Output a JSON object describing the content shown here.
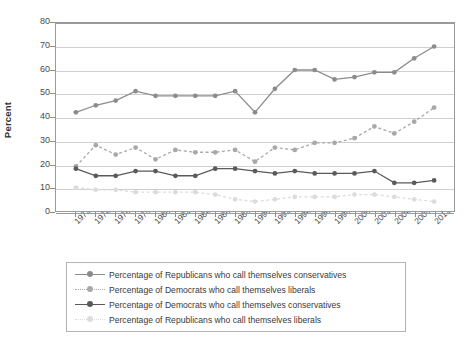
{
  "chart_data": {
    "type": "line",
    "title": "",
    "xlabel": "",
    "ylabel": "Percent",
    "ylim": [
      0,
      80
    ],
    "ytick_step": 10,
    "grid": true,
    "legend_position": "bottom",
    "categories": [
      "1972",
      "1974",
      "1976",
      "1978",
      "1980",
      "1982",
      "1984",
      "1986",
      "1988",
      "1990",
      "1992",
      "1994",
      "1996",
      "1998",
      "2000",
      "2002",
      "2004",
      "2008",
      "2012"
    ],
    "ytick_labels": [
      "0",
      "10",
      "20",
      "30",
      "40",
      "50",
      "60",
      "70",
      "80"
    ],
    "xtick_labels": [
      "1972",
      "1974",
      "1976",
      "1978",
      "1980",
      "1982",
      "1984",
      "1986",
      "1988",
      "1990",
      "1992",
      "1994",
      "1996",
      "1998",
      "2000",
      "2002",
      "2004",
      "2008",
      "2012"
    ],
    "series": [
      {
        "name": "Percentage of Republicans who call themselves conservatives",
        "key": "rep_cons",
        "color": "#8c8c8c",
        "style": "solid",
        "values": [
          42,
          45,
          47,
          51,
          49,
          49,
          49,
          49,
          51,
          42,
          52,
          60,
          60,
          56,
          57,
          59,
          59,
          65,
          70
        ]
      },
      {
        "name": "Percentage of Democrats who call themselves liberals",
        "key": "dem_lib",
        "color": "#a8a8a8",
        "style": "dotted",
        "values": [
          19,
          28,
          24,
          27,
          22,
          26,
          25,
          25,
          26,
          21,
          27,
          26,
          29,
          29,
          31,
          36,
          33,
          38,
          44
        ]
      },
      {
        "name": "Percentage of Democrats who call themselves conservatives",
        "key": "dem_cons",
        "color": "#5a5a5a",
        "style": "solid",
        "values": [
          18,
          15,
          15,
          17,
          17,
          15,
          15,
          18,
          18,
          17,
          16,
          17,
          16,
          16,
          16,
          17,
          12,
          12,
          13
        ]
      },
      {
        "name": "Percentage of Republicans who call themselves liberals",
        "key": "rep_lib",
        "color": "#dcdcdc",
        "style": "dotted",
        "values": [
          10,
          9,
          9,
          8,
          8,
          8,
          8,
          7,
          5,
          4,
          5,
          6,
          6,
          6,
          7,
          7,
          6,
          5,
          4
        ]
      }
    ]
  },
  "legend": {
    "items": [
      {
        "label": "Percentage of Republicans who call themselves conservatives",
        "color": "#8c8c8c",
        "style": "solid"
      },
      {
        "label": "Percentage of Democrats who call themselves liberals",
        "color": "#a8a8a8",
        "style": "dotted"
      },
      {
        "label": "Percentage of Democrats who call themselves conservatives",
        "color": "#5a5a5a",
        "style": "solid"
      },
      {
        "label": "Percentage of Republicans who call themselves liberals",
        "color": "#dcdcdc",
        "style": "dotted"
      }
    ]
  }
}
